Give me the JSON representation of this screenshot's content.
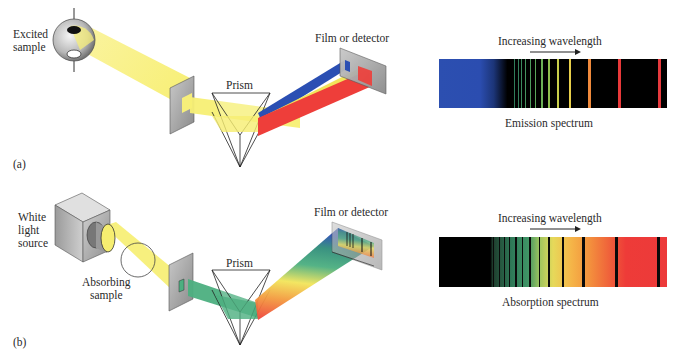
{
  "panel_a": {
    "tag": "(a)",
    "source_label_line1": "Excited",
    "source_label_line2": "sample",
    "prism_label": "Prism",
    "detector_label": "Film or detector",
    "arrow_label": "Increasing wavelength",
    "spectrum_caption": "Emission spectrum",
    "spectrum": {
      "background_gradient": [
        "#2c4fb0",
        "#2a4cae",
        "#1a2f6a",
        "#000000"
      ],
      "lines": [
        {
          "pos": 0.33,
          "color": "#2f7d5a",
          "w": 1
        },
        {
          "pos": 0.345,
          "color": "#347f5c",
          "w": 1
        },
        {
          "pos": 0.36,
          "color": "#3b8a5e",
          "w": 1
        },
        {
          "pos": 0.378,
          "color": "#45935f",
          "w": 1
        },
        {
          "pos": 0.398,
          "color": "#4e9c5d",
          "w": 1.5
        },
        {
          "pos": 0.42,
          "color": "#5aa65a",
          "w": 1.5
        },
        {
          "pos": 0.448,
          "color": "#6cb157",
          "w": 1.5
        },
        {
          "pos": 0.48,
          "color": "#8fbf4e",
          "w": 2
        },
        {
          "pos": 0.518,
          "color": "#c9cf4a",
          "w": 2
        },
        {
          "pos": 0.572,
          "color": "#e8cf4a",
          "w": 2
        },
        {
          "pos": 0.655,
          "color": "#f08a3c",
          "w": 2.5
        },
        {
          "pos": 0.785,
          "color": "#e8393a",
          "w": 3
        },
        {
          "pos": 0.96,
          "color": "#e63a3e",
          "w": 3
        }
      ]
    }
  },
  "panel_b": {
    "tag": "(b)",
    "source_label_line1": "White",
    "source_label_line2": "light",
    "source_label_line3": "source",
    "sample_label_line1": "Absorbing",
    "sample_label_line2": "sample",
    "prism_label": "Prism",
    "detector_label": "Film or detector",
    "arrow_label": "Increasing wavelength",
    "spectrum_caption": "Absorption spectrum",
    "spectrum": {
      "gradient_stops": [
        {
          "pos": 0.0,
          "color": "#000000"
        },
        {
          "pos": 0.225,
          "color": "#000000"
        },
        {
          "pos": 0.235,
          "color": "#1e3c2c"
        },
        {
          "pos": 0.32,
          "color": "#2f7a58"
        },
        {
          "pos": 0.39,
          "color": "#3f9466"
        },
        {
          "pos": 0.44,
          "color": "#9cc45e"
        },
        {
          "pos": 0.5,
          "color": "#e6d95a"
        },
        {
          "pos": 0.58,
          "color": "#f5b548"
        },
        {
          "pos": 0.66,
          "color": "#f3913d"
        },
        {
          "pos": 0.76,
          "color": "#ef5a3a"
        },
        {
          "pos": 0.82,
          "color": "#ee3b38"
        },
        {
          "pos": 1.0,
          "color": "#ec3a3a"
        }
      ],
      "lines": [
        {
          "pos": 0.235,
          "w": 1
        },
        {
          "pos": 0.262,
          "w": 1
        },
        {
          "pos": 0.285,
          "w": 1
        },
        {
          "pos": 0.308,
          "w": 1
        },
        {
          "pos": 0.335,
          "w": 1.2
        },
        {
          "pos": 0.362,
          "w": 1.2
        },
        {
          "pos": 0.395,
          "w": 1.5
        },
        {
          "pos": 0.437,
          "w": 1.8
        },
        {
          "pos": 0.48,
          "w": 1.8
        },
        {
          "pos": 0.538,
          "w": 2
        },
        {
          "pos": 0.628,
          "w": 2.5
        },
        {
          "pos": 0.77,
          "w": 3
        },
        {
          "pos": 0.955,
          "w": 3
        }
      ]
    }
  },
  "colors": {
    "beam_yellow": "#f6f07a",
    "beam_green": "#4caf80",
    "blue": "#2b4fb3",
    "red": "#ee3e3a",
    "plate": "#9a9a9a"
  }
}
